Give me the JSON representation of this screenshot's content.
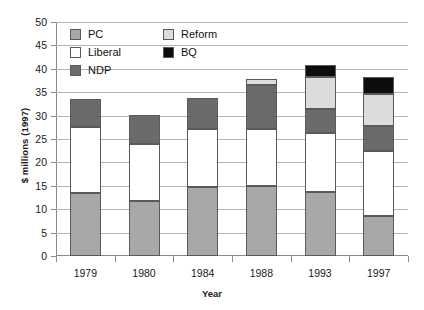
{
  "chart_data": {
    "type": "bar",
    "subtype": "stacked-bar",
    "title": "",
    "xlabel": "Year",
    "ylabel": "$ millions (1997)",
    "categories": [
      "1979",
      "1980",
      "1984",
      "1988",
      "1993",
      "1997"
    ],
    "ylim": [
      0,
      50
    ],
    "ytick_step": 5,
    "ytick_labels": [
      "0",
      "5",
      "10",
      "15",
      "20",
      "25",
      "30",
      "35",
      "40",
      "45",
      "50"
    ],
    "grid": true,
    "legend_position": "top-left-inside",
    "series": [
      {
        "name": "PC",
        "color": "#a8a8a8",
        "values": [
          13.5,
          11.8,
          14.7,
          14.9,
          13.7,
          8.5
        ]
      },
      {
        "name": "Liberal",
        "color": "#ffffff",
        "values": [
          14.0,
          12.2,
          12.5,
          12.3,
          12.6,
          14.0
        ]
      },
      {
        "name": "NDP",
        "color": "#6b6b6b",
        "values": [
          6.0,
          6.2,
          6.6,
          9.3,
          5.2,
          5.2
        ]
      },
      {
        "name": "Reform",
        "color": "#dcdcdc",
        "values": [
          0,
          0,
          0,
          1.3,
          6.7,
          7.0
        ]
      },
      {
        "name": "BQ",
        "color": "#0d0d0d",
        "values": [
          0,
          0,
          0,
          0,
          2.6,
          3.5
        ]
      }
    ],
    "totals": [
      33.5,
      30.2,
      33.8,
      37.8,
      40.8,
      38.2
    ]
  },
  "legend": {
    "items": [
      {
        "label": "PC",
        "color": "#a8a8a8"
      },
      {
        "label": "Reform",
        "color": "#dcdcdc"
      },
      {
        "label": "Liberal",
        "color": "#ffffff"
      },
      {
        "label": "BQ",
        "color": "#0d0d0d"
      },
      {
        "label": "NDP",
        "color": "#6b6b6b"
      }
    ]
  },
  "axes": {
    "y_title": "$ millions (1997)",
    "x_title": "Year"
  }
}
